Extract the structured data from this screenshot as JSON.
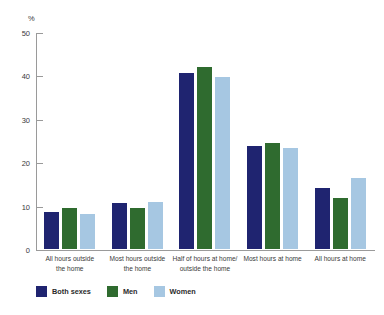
{
  "chart_data": {
    "type": "bar",
    "title": "",
    "xlabel": "",
    "ylabel": "%",
    "ylim": [
      0,
      50
    ],
    "yticks": [
      0,
      10,
      20,
      30,
      40,
      50
    ],
    "grid": false,
    "legend_position": "bottom-left",
    "categories": [
      "All hours outside the home",
      "Most hours outside the home",
      "Half of hours at home/ outside the home",
      "Most hours at home",
      "All hours at home"
    ],
    "category_lines": [
      [
        "All hours outside",
        "the home"
      ],
      [
        "Most hours outside",
        "the home"
      ],
      [
        "Half of hours at home/",
        "outside the home"
      ],
      [
        "Most hours at home"
      ],
      [
        "All hours at home"
      ]
    ],
    "series": [
      {
        "name": "Both sexes",
        "color": "#1f2470",
        "values": [
          9.0,
          11.0,
          41.0,
          24.3,
          14.5
        ]
      },
      {
        "name": "Men",
        "color": "#2f6b2f",
        "values": [
          10.0,
          10.0,
          42.3,
          25.0,
          12.2
        ]
      },
      {
        "name": "Women",
        "color": "#a6c7e2",
        "values": [
          8.5,
          11.3,
          40.0,
          23.7,
          16.8
        ]
      }
    ]
  },
  "axis": {
    "unit_label": "%",
    "tick_labels": [
      "50",
      "40",
      "30",
      "20",
      "10",
      "0"
    ]
  },
  "legend": {
    "items": [
      {
        "label": "Both sexes",
        "color": "#1f2470",
        "swatch": "legend-swatch-both-sexes"
      },
      {
        "label": "Men",
        "color": "#2f6b2f",
        "swatch": "legend-swatch-men"
      },
      {
        "label": "Women",
        "color": "#a6c7e2",
        "swatch": "legend-swatch-women"
      }
    ]
  }
}
